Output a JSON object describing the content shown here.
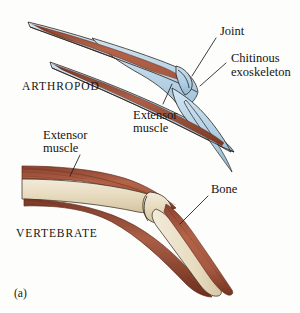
{
  "figure": {
    "panel_label": "(a)",
    "background_color": "#fdfdfc"
  },
  "palette": {
    "exoskeleton_blue": "#b8d4e8",
    "exoskeleton_blue_light": "#d3e6f3",
    "exoskeleton_blue_dark": "#8fb8d4",
    "muscle_red": "#a85a42",
    "muscle_red_dark": "#7d3a28",
    "muscle_red_light": "#c07a5e",
    "bone_cream": "#e8dcc0",
    "bone_cream_light": "#f2eadb",
    "bone_shadow": "#cdbd9a",
    "outline_dark": "#2b2119",
    "text_black": "#161412"
  },
  "diagrams": {
    "arthropod": {
      "name": "ARTHROPOD",
      "labels": {
        "taxon": "ARTHROPOD",
        "joint": "Joint",
        "exoskeleton_line1": "Chitinous",
        "exoskeleton_line2": "exoskeleton",
        "extensor_line1": "Extensor",
        "extensor_line2": "muscle"
      }
    },
    "vertebrate": {
      "name": "VERTEBRATE",
      "labels": {
        "taxon": "VERTEBRATE",
        "extensor_line1": "Extensor",
        "extensor_line2": "muscle",
        "bone": "Bone"
      }
    }
  }
}
